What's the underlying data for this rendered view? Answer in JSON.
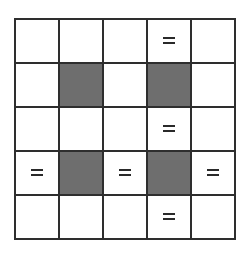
{
  "board": {
    "rows": 5,
    "cols": 5,
    "colors": {
      "dark_cell": "#6e6e6e",
      "light_cell": "#ffffff",
      "grid_line": "#2e2e2e"
    },
    "cells": [
      [
        "empty",
        "empty",
        "empty",
        "equals",
        "empty"
      ],
      [
        "empty",
        "dark",
        "empty",
        "dark",
        "empty"
      ],
      [
        "empty",
        "empty",
        "empty",
        "equals",
        "empty"
      ],
      [
        "equals",
        "dark",
        "equals",
        "dark",
        "equals"
      ],
      [
        "empty",
        "empty",
        "empty",
        "equals",
        "empty"
      ]
    ],
    "equals_symbol": "="
  }
}
